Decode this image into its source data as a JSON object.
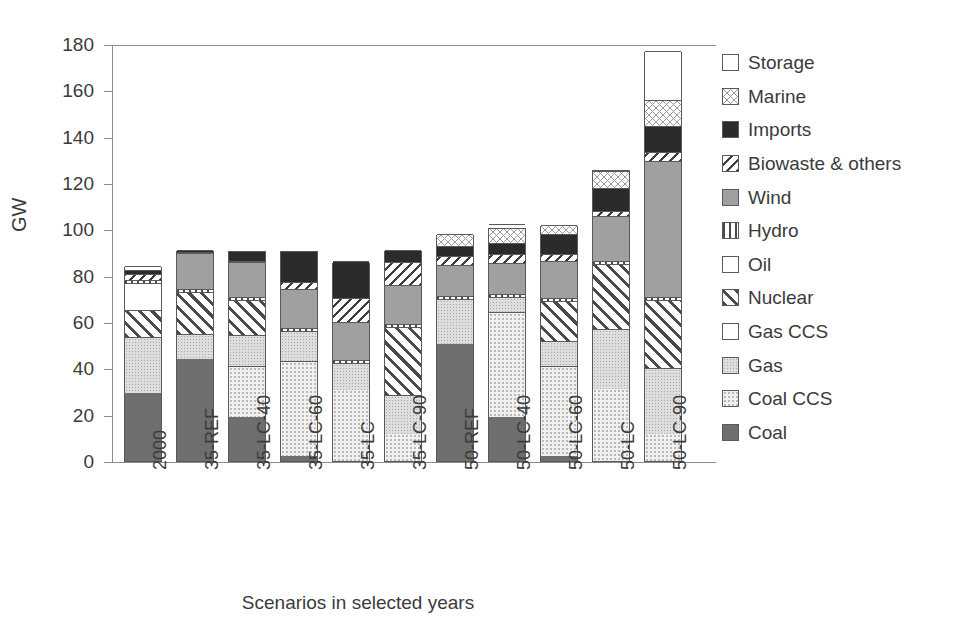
{
  "chart_data": {
    "type": "bar",
    "stacked": true,
    "title": "",
    "xlabel": "Scenarios in selected years",
    "ylabel": "GW",
    "ylim": [
      0,
      180
    ],
    "yticks": [
      0,
      20,
      40,
      60,
      80,
      100,
      120,
      140,
      160,
      180
    ],
    "grid": false,
    "legend_position": "right",
    "categories": [
      "2000",
      "35-REF",
      "35-LC-40",
      "35-LC-60",
      "35-LC",
      "35-LC-90",
      "50-REF",
      "50-LC-40",
      "50-LC-60",
      "50-LC",
      "50-LC-90"
    ],
    "series": [
      {
        "name": "Coal",
        "fill": "f-coal",
        "values": [
          29.5,
          44.0,
          19.0,
          2.0,
          0.0,
          0.0,
          50.5,
          19.0,
          2.0,
          0.0,
          0.0
        ]
      },
      {
        "name": "Coal CCS",
        "fill": "f-coalccs",
        "values": [
          0.0,
          0.0,
          22.0,
          41.0,
          30.5,
          11.5,
          0.0,
          45.5,
          39.0,
          31.0,
          11.5
        ]
      },
      {
        "name": "Gas",
        "fill": "f-gas",
        "values": [
          24.0,
          11.0,
          13.5,
          13.0,
          12.0,
          17.0,
          19.5,
          6.5,
          11.0,
          26.0,
          28.5
        ]
      },
      {
        "name": "Gas CCS",
        "fill": "f-gasccs",
        "values": [
          0.0,
          0.0,
          0.0,
          0.0,
          0.0,
          0.0,
          0.0,
          0.0,
          0.0,
          0.0,
          0.0
        ]
      },
      {
        "name": "Nuclear",
        "fill": "f-nuclear",
        "values": [
          11.5,
          18.0,
          15.0,
          0.0,
          0.0,
          29.5,
          0.0,
          0.0,
          17.0,
          28.0,
          29.5
        ]
      },
      {
        "name": "Oil",
        "fill": "f-oil",
        "values": [
          12.0,
          0.0,
          0.0,
          0.0,
          0.0,
          0.0,
          0.0,
          0.0,
          0.0,
          0.0,
          0.0
        ]
      },
      {
        "name": "Hydro",
        "fill": "f-hydro",
        "values": [
          1.3,
          1.3,
          1.3,
          1.3,
          1.3,
          1.3,
          1.3,
          1.3,
          1.3,
          1.3,
          1.3
        ]
      },
      {
        "name": "Wind",
        "fill": "f-wind",
        "values": [
          0.0,
          15.5,
          15.0,
          17.0,
          16.0,
          16.5,
          13.5,
          13.0,
          16.0,
          19.5,
          58.5
        ]
      },
      {
        "name": "Biowaste & others",
        "fill": "f-biowaste",
        "values": [
          2.5,
          0.5,
          0.5,
          3.0,
          10.5,
          10.0,
          3.5,
          4.0,
          3.0,
          2.0,
          4.0
        ]
      },
      {
        "name": "Imports",
        "fill": "f-imports",
        "values": [
          1.8,
          1.0,
          4.5,
          13.5,
          16.0,
          5.5,
          4.5,
          5.0,
          8.5,
          10.0,
          11.5
        ]
      },
      {
        "name": "Marine",
        "fill": "f-marine",
        "values": [
          0.0,
          0.0,
          0.0,
          0.0,
          0.0,
          0.0,
          5.0,
          6.5,
          4.0,
          7.5,
          11.0
        ]
      },
      {
        "name": "Storage",
        "fill": "f-storage",
        "values": [
          1.5,
          0.0,
          0.0,
          0.0,
          0.0,
          0.0,
          0.0,
          1.5,
          0.0,
          0.0,
          21.0
        ]
      }
    ],
    "totals": [
      84,
      91,
      91,
      91,
      86,
      91,
      98,
      101,
      102,
      126,
      177
    ]
  },
  "legend": {
    "items": [
      {
        "label": "Storage",
        "fill": "f-storage"
      },
      {
        "label": "Marine",
        "fill": "f-marine"
      },
      {
        "label": "Imports",
        "fill": "f-imports"
      },
      {
        "label": "Biowaste & others",
        "fill": "f-biowaste"
      },
      {
        "label": "Wind",
        "fill": "f-wind"
      },
      {
        "label": "Hydro",
        "fill": "f-hydro"
      },
      {
        "label": "Oil",
        "fill": "f-oil"
      },
      {
        "label": "Nuclear",
        "fill": "f-nuclear"
      },
      {
        "label": "Gas CCS",
        "fill": "f-gasccs"
      },
      {
        "label": "Gas",
        "fill": "f-gas"
      },
      {
        "label": "Coal CCS",
        "fill": "f-coalccs"
      },
      {
        "label": "Coal",
        "fill": "f-coal"
      }
    ]
  },
  "colors": {
    "axis": "#8c8c8c",
    "text": "#3b3b3b",
    "outline": "#595959"
  }
}
